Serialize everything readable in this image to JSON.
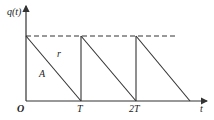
{
  "diagram": {
    "y_axis_label": "q(t)",
    "x_axis_label": "t",
    "origin_label": "O",
    "x_ticks": [
      "T",
      "2T"
    ],
    "annotations": {
      "slope_label": "r",
      "area_label": "A"
    },
    "max_level_line": "dashed",
    "cycles": 3,
    "colors": {
      "line": "#333333",
      "background": "#ffffff"
    }
  }
}
